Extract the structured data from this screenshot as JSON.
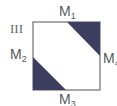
{
  "figure": {
    "panel_label": "III",
    "square": {
      "x": 33,
      "y": 22,
      "w": 67,
      "h": 68,
      "stroke": "#8a8d91"
    },
    "fill_color": "#3d3d60",
    "triangles": [
      {
        "name": "top-right",
        "points": "67,22 100,22 100,56"
      },
      {
        "name": "bottom-left",
        "points": "33,57 33,90 66,90"
      }
    ],
    "labels": [
      {
        "id": "M1",
        "base": "M",
        "sub": "1"
      },
      {
        "id": "M2",
        "base": "M",
        "sub": "2"
      },
      {
        "id": "M3",
        "base": "M",
        "sub": "3"
      },
      {
        "id": "M4",
        "base": "M",
        "sub": "4"
      }
    ]
  }
}
